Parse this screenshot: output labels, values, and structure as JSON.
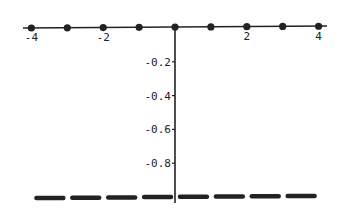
{
  "chart_data": {
    "type": "scatter",
    "title": "",
    "xlabel": "",
    "ylabel": "",
    "xlim": [
      -4,
      4
    ],
    "ylim": [
      -1,
      0
    ],
    "grid": false,
    "legend": null,
    "x_ticks": [
      -4,
      -2,
      2,
      4
    ],
    "x_tick_labels": [
      "-4",
      "-2",
      "2",
      "4"
    ],
    "y_ticks": [
      -0.2,
      -0.4,
      -0.6,
      -0.8
    ],
    "y_tick_labels": [
      "-0.2",
      "-0.4",
      "-0.6",
      "-0.8"
    ],
    "series": [
      {
        "name": "points at integers",
        "style": "dots",
        "x": [
          -4,
          -3,
          -2,
          -1,
          0,
          1,
          2,
          3,
          4
        ],
        "y": [
          0,
          0,
          0,
          0,
          0,
          0,
          0,
          0,
          0
        ]
      },
      {
        "name": "segments between integers",
        "style": "thick horizontal segments",
        "segments": [
          {
            "x0": -4,
            "x1": -3,
            "y": -1
          },
          {
            "x0": -3,
            "x1": -2,
            "y": -1
          },
          {
            "x0": -2,
            "x1": -1,
            "y": -1
          },
          {
            "x0": -1,
            "x1": 0,
            "y": -1
          },
          {
            "x0": 0,
            "x1": 1,
            "y": -1
          },
          {
            "x0": 1,
            "x1": 2,
            "y": -1
          },
          {
            "x0": 2,
            "x1": 3,
            "y": -1
          },
          {
            "x0": 3,
            "x1": 4,
            "y": -1
          }
        ]
      }
    ],
    "colors": {
      "ink": "#222222",
      "background": "#ffffff"
    }
  }
}
